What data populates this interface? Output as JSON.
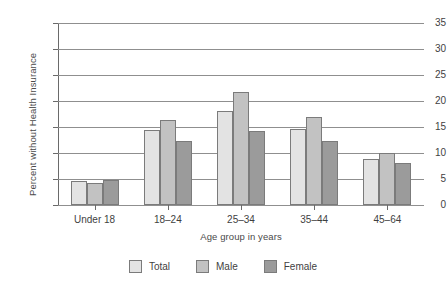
{
  "chart_data": {
    "type": "bar",
    "title": "",
    "subtitle": "",
    "xlabel": "Age group in years",
    "ylabel": "Percent without Health Insurance",
    "categories": [
      "Under 18",
      "18–24",
      "25–34",
      "35–44",
      "45–64"
    ],
    "series": [
      {
        "name": "Total",
        "values": [
          4.6,
          14.5,
          18.1,
          14.6,
          8.9
        ],
        "color": "#e3e3e3"
      },
      {
        "name": "Male",
        "values": [
          4.3,
          16.4,
          21.7,
          16.9,
          10.0
        ],
        "color": "#c2c2c2"
      },
      {
        "name": "Female",
        "values": [
          4.8,
          12.3,
          14.3,
          12.3,
          8.1
        ],
        "color": "#9b9b9b"
      }
    ],
    "ylim": [
      0,
      35
    ],
    "yticks": [
      0,
      5,
      10,
      15,
      20,
      25,
      30,
      35
    ],
    "ytick_labels": [
      "0",
      "5",
      "10",
      "15",
      "20",
      "25",
      "30",
      "35"
    ],
    "grid": true,
    "grid_axis": "y",
    "legend_position": "bottom",
    "bar_border_color": "#7b7b7b",
    "grid_color": "#8f8f8f",
    "axis_color": "#6a6a6a",
    "background": "#ffffff"
  }
}
